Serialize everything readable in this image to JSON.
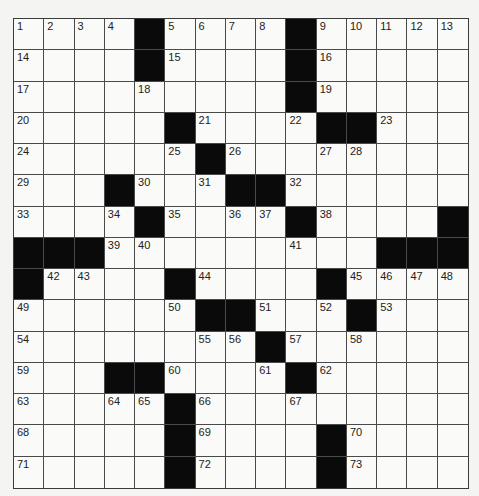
{
  "puzzle": {
    "rows": 15,
    "cols": 15,
    "grid": [
      [
        "1",
        "2",
        "3",
        "4",
        "#",
        "5",
        "6",
        "7",
        "8",
        "#",
        "9",
        "10",
        "11",
        "12",
        "13"
      ],
      [
        "14",
        "",
        "",
        "",
        "#",
        "15",
        "",
        "",
        "",
        "#",
        "16",
        "",
        "",
        "",
        ""
      ],
      [
        "17",
        "",
        "",
        "",
        "18",
        "",
        "",
        "",
        "",
        "#",
        "19",
        "",
        "",
        "",
        ""
      ],
      [
        "20",
        "",
        "",
        "",
        "",
        "#",
        "21",
        "",
        "",
        "22",
        "#",
        "#",
        "23",
        "",
        ""
      ],
      [
        "24",
        "",
        "",
        "",
        "",
        "25",
        "#",
        "26",
        "",
        "",
        "27",
        "28",
        "",
        "",
        ""
      ],
      [
        "29",
        "",
        "",
        "#",
        "30",
        "",
        "31",
        "#",
        "#",
        "32",
        "",
        "",
        "",
        "",
        ""
      ],
      [
        "33",
        "",
        "",
        "34",
        "#",
        "35",
        "",
        "36",
        "37",
        "#",
        "38",
        "",
        "",
        "",
        "#"
      ],
      [
        "#",
        "#",
        "#",
        "39",
        "40",
        "",
        "",
        "",
        "",
        "41",
        "",
        "",
        "#",
        "#",
        "#"
      ],
      [
        "#",
        "42",
        "43",
        "",
        "",
        "#",
        "44",
        "",
        "",
        "",
        "#",
        "45",
        "46",
        "47",
        "48"
      ],
      [
        "49",
        "",
        "",
        "",
        "",
        "50",
        "#",
        "#",
        "51",
        "",
        "52",
        "#",
        "53",
        "",
        ""
      ],
      [
        "54",
        "",
        "",
        "",
        "",
        "",
        "55",
        "56",
        "#",
        "57",
        "",
        "58",
        "",
        "",
        ""
      ],
      [
        "59",
        "",
        "",
        "#",
        "#",
        "60",
        "",
        "",
        "61",
        "#",
        "62",
        "",
        "",
        "",
        ""
      ],
      [
        "63",
        "",
        "",
        "64",
        "65",
        "#",
        "66",
        "",
        "",
        "67",
        "",
        "",
        "",
        "",
        ""
      ],
      [
        "68",
        "",
        "",
        "",
        "",
        "#",
        "69",
        "",
        "",
        "",
        "#",
        "70",
        "",
        "",
        ""
      ],
      [
        "71",
        "",
        "",
        "",
        "",
        "#",
        "72",
        "",
        "",
        "",
        "#",
        "73",
        "",
        "",
        ""
      ]
    ]
  },
  "colors": {
    "black": "#0a0a0a",
    "white": "#fafaf8",
    "line": "#4a4a4a"
  }
}
